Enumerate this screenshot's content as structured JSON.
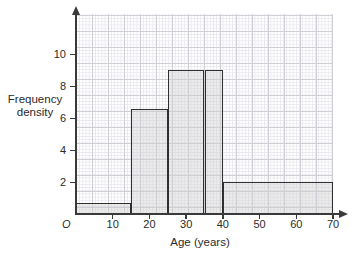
{
  "chart_data": {
    "type": "bar",
    "title": "",
    "subtitle": "",
    "xlabel": "Age (years)",
    "ylabel": "Frequency density",
    "ylabel_line1": "Frequency",
    "ylabel_line2": "density",
    "origin_label": "O",
    "grid": true,
    "legend": "none",
    "xlim": [
      0,
      70
    ],
    "ylim": [
      0,
      10.7
    ],
    "xticks": [
      10,
      20,
      30,
      40,
      50,
      60,
      70
    ],
    "xtick_labels": [
      "10",
      "20",
      "30",
      "40",
      "50",
      "60",
      "70"
    ],
    "yticks": [
      2,
      4,
      6,
      8,
      10
    ],
    "ytick_labels": [
      "2",
      "4",
      "6",
      "8",
      "10"
    ],
    "bins": [
      {
        "label": "0-15",
        "x_start": 0,
        "x_end": 15,
        "frequency_density": 0.7,
        "frequency": 10.5
      },
      {
        "label": "15-25",
        "x_start": 15,
        "x_end": 25,
        "frequency_density": 6.6,
        "frequency": 66
      },
      {
        "label": "25-35",
        "x_start": 25,
        "x_end": 35,
        "frequency_density": 9,
        "frequency": 90
      },
      {
        "label": "35-40",
        "x_start": 35,
        "x_end": 40,
        "frequency_density": 9,
        "frequency": 45
      },
      {
        "label": "40-70",
        "x_start": 40,
        "x_end": 70,
        "frequency_density": 2,
        "frequency": 60
      }
    ],
    "bar_fill_color": "#cdcdcd",
    "bar_edge_color": "#2f2f2f",
    "grid_major_color": "#cfcfd6",
    "grid_minor_color": "#e8e8ee",
    "axis_color": "#3a3a3a"
  }
}
